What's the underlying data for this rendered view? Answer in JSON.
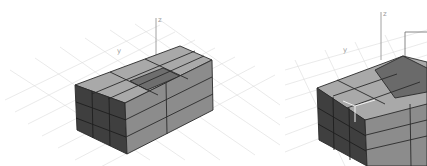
{
  "viewports": [
    {
      "id": "left",
      "view": "perspective",
      "model": "box-grid-3x3x3",
      "selected_cell": "top-center",
      "gizmo_labels": {
        "z": "z",
        "y": "y"
      },
      "colors": {
        "top": "#a9a9a9",
        "selected_top": "#6e6e6e",
        "front": "#3f3f3f",
        "side": "#8c8c8c",
        "edge": "#2a2a2a",
        "grid": "#d9d9d9",
        "background": "#ffffff"
      }
    },
    {
      "id": "right",
      "view": "perspective",
      "model": "box-grid-with-raised-peak",
      "gizmo_labels": {
        "z": "z",
        "y": "y"
      },
      "colors": {
        "top": "#a9a9a9",
        "peak": "#6a6a6a",
        "front": "#3f3f3f",
        "side": "#8c8c8c",
        "edge": "#2a2a2a",
        "grid": "#d9d9d9",
        "background": "#ffffff"
      }
    }
  ]
}
